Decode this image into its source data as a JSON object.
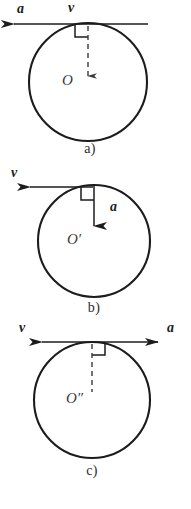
{
  "figure": {
    "background_color": "#ffffff",
    "stroke_color": "#1c1c1c",
    "panels": [
      {
        "id": "a",
        "caption": "a)",
        "center_label": "O",
        "circle": {
          "cx": 88,
          "cy": 82,
          "r": 59
        },
        "tangent_point": {
          "x": 88,
          "y": 23
        },
        "vectors": [
          {
            "name": "a",
            "label": "a",
            "direction": "left",
            "style": "solid",
            "x1": 148,
            "y1": 24,
            "x2": 12,
            "y2": 24,
            "label_x": 17,
            "label_y": 2
          },
          {
            "name": "v",
            "label": "v",
            "direction": "left",
            "style": "tangent-line",
            "label_x": 68,
            "label_y": 1
          }
        ],
        "radius_line": {
          "style": "dashed",
          "from": "tangent_point",
          "to": "center",
          "arrowhead": "small-down"
        },
        "right_angle": {
          "opens": "left",
          "size": 13
        }
      },
      {
        "id": "b",
        "caption": "b)",
        "center_label": "O′",
        "circle": {
          "cx": 94,
          "cy": 241,
          "r": 56
        },
        "tangent_point": {
          "x": 94,
          "y": 186
        },
        "vectors": [
          {
            "name": "v",
            "label": "v",
            "direction": "left",
            "style": "solid",
            "x1": 94,
            "y1": 187,
            "x2": 28,
            "y2": 187,
            "label_x": 11,
            "label_y": 165
          },
          {
            "name": "a",
            "label": "a",
            "direction": "down",
            "style": "solid",
            "x1": 94,
            "y1": 187,
            "x2": 94,
            "y2": 228,
            "label_x": 110,
            "label_y": 199
          }
        ],
        "radius_line": null,
        "right_angle": {
          "opens": "left",
          "size": 13
        }
      },
      {
        "id": "c",
        "caption": "c)",
        "center_label": "O″",
        "circle": {
          "cx": 92,
          "cy": 400,
          "r": 58
        },
        "tangent_point": {
          "x": 92,
          "y": 342
        },
        "vectors": [
          {
            "name": "v",
            "label": "v",
            "direction": "left",
            "style": "solid",
            "x1": 92,
            "y1": 342,
            "x2": 40,
            "y2": 342,
            "label_x": 19,
            "label_y": 320
          },
          {
            "name": "a",
            "label": "a",
            "direction": "right",
            "style": "solid",
            "x1": 92,
            "y1": 342,
            "x2": 160,
            "y2": 342,
            "label_x": 167,
            "label_y": 320
          }
        ],
        "radius_line": {
          "style": "dashed",
          "from": "tangent_point",
          "to": "center",
          "arrowhead": "none"
        },
        "right_angle": {
          "opens": "right",
          "size": 13
        }
      }
    ],
    "captions": [
      {
        "text": "a)",
        "x": 70,
        "y": 141
      },
      {
        "text": "b)",
        "x": 74,
        "y": 300
      },
      {
        "text": "c)",
        "x": 72,
        "y": 463
      }
    ]
  }
}
